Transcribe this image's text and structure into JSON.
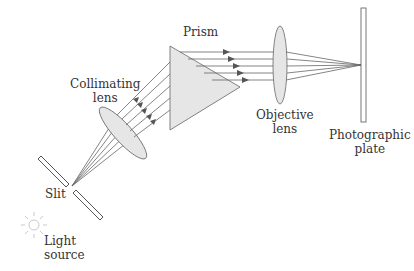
{
  "diagram": {
    "labels": {
      "prism": "Prism",
      "collimating_lens": [
        "Collimating",
        "lens"
      ],
      "objective_lens": [
        "Objective",
        "lens"
      ],
      "photographic_plate": [
        "Photographic",
        "plate"
      ],
      "slit": "Slit",
      "light_source": [
        "Light",
        "source"
      ]
    },
    "colors": {
      "line": "#555555",
      "glass_fill": "#e6e6e6",
      "background": "#ffffff"
    }
  }
}
